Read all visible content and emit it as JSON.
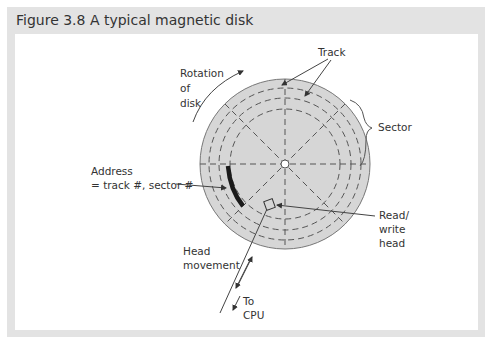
{
  "figure": {
    "title": "Figure 3.8  A typical magnetic disk"
  },
  "diagram": {
    "labels": {
      "track": "Track",
      "sector": "Sector",
      "rotation_line1": "Rotation",
      "rotation_line2": "of",
      "rotation_line3": "disk",
      "address_line1": "Address",
      "address_line2": "= track #, sector #",
      "read_write_line1": "Read/",
      "read_write_line2": "write",
      "read_write_line3": "head",
      "head_movement_line1": "Head",
      "head_movement_line2": "movement",
      "to_cpu_line1": "To",
      "to_cpu_line2": "CPU"
    },
    "colors": {
      "frame": "#e3e3e3",
      "disk_fill": "#d6d6d6",
      "lines": "#555555",
      "address_arc": "#1a1a1a"
    }
  }
}
